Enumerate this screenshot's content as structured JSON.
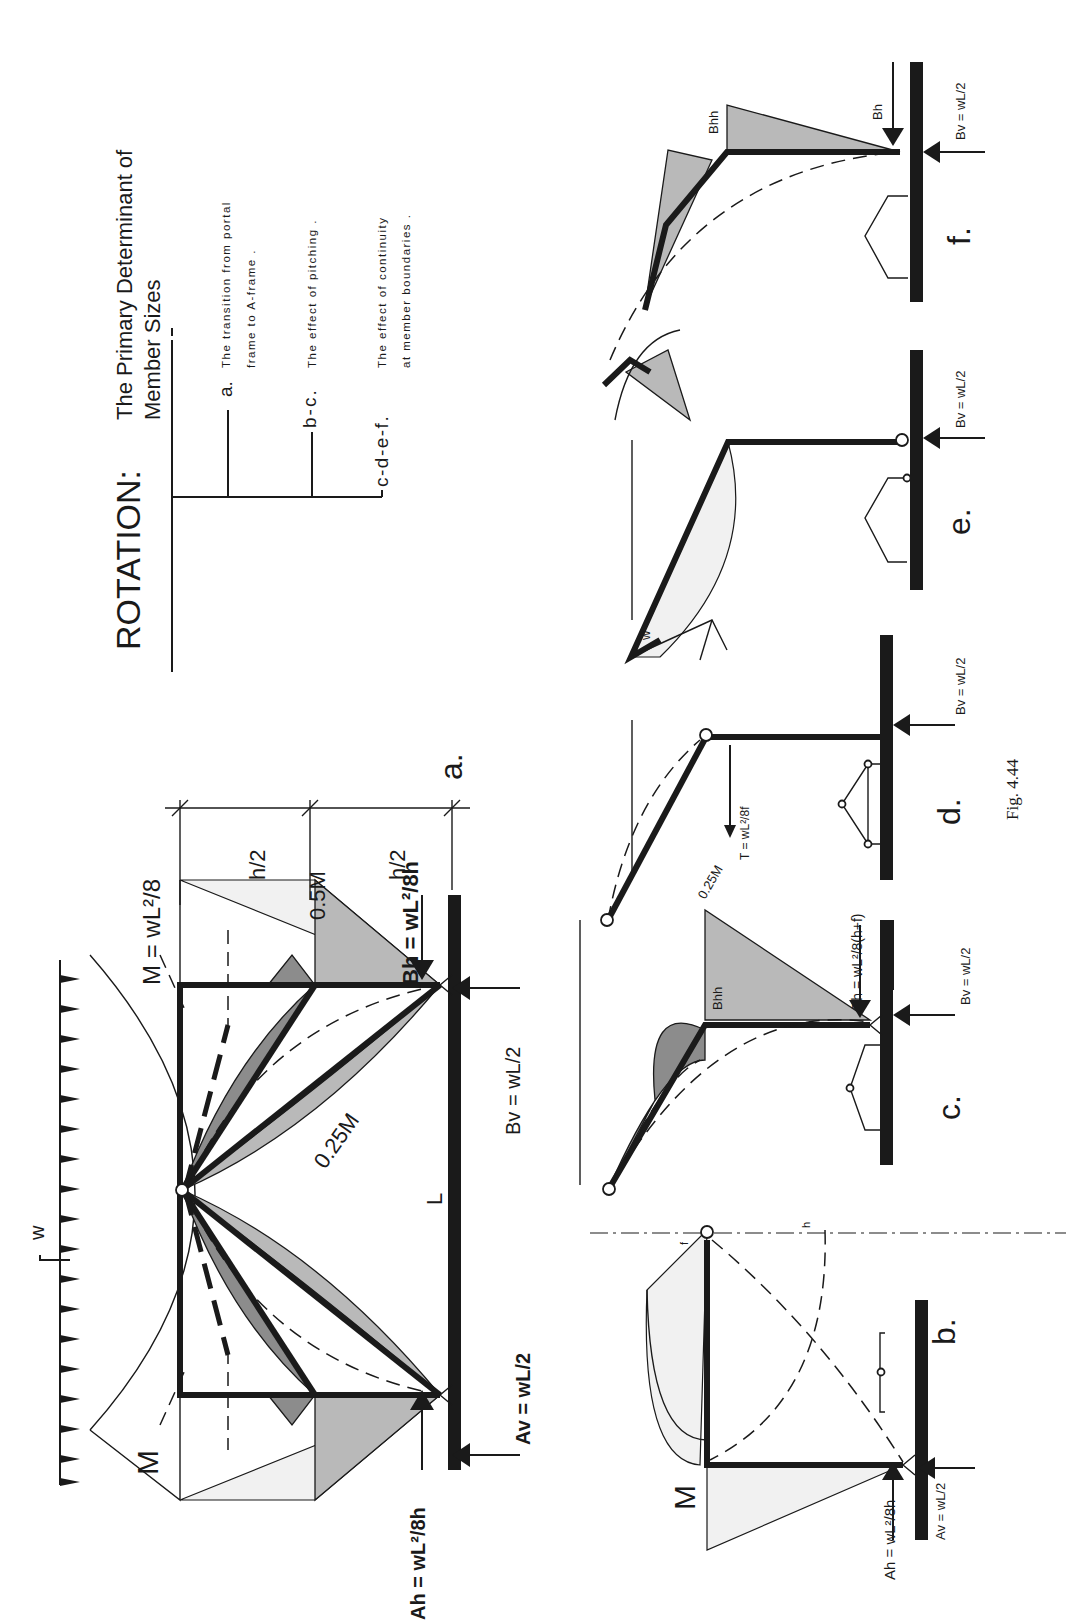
{
  "title": {
    "heading": "ROTATION:",
    "subtitle_line1": "The Primary Determinant of",
    "subtitle_line2": "Member Sizes"
  },
  "legend": [
    {
      "key": "a.",
      "line1": "The transition from portal",
      "line2": "frame to A-frame ."
    },
    {
      "key": "b-c.",
      "line1": "The effect of pitching .",
      "line2": ""
    },
    {
      "key": "c-d-e-f.",
      "line1": "The effect of continuity",
      "line2": "at member boundaries ."
    }
  ],
  "panel_a": {
    "label": "a.",
    "load_label": "w",
    "moment_label": "M",
    "moment_formula": "M = wL²/8",
    "half_moment": "0.5M",
    "quarter_moment": "0.25M",
    "dim_top": "h/2",
    "dim_bottom": "h/2",
    "span_label": "L",
    "Ah": "Ah = wL²/8h",
    "Av": "Av = wL/2",
    "Bh": "Bh = wL²/8h",
    "Bv": "Bv = wL/2"
  },
  "panel_b": {
    "label": "b.",
    "moment_label": "M",
    "f_label": "f",
    "h_label": "h",
    "Ah": "Ah = wL²/8h",
    "Av": "Av = wL/2"
  },
  "panel_c": {
    "label": "c.",
    "moment_label": "Bhh",
    "Bh": "Bh = wL²/8(h+f)",
    "Bv": "Bv = wL/2"
  },
  "panel_d": {
    "label": "d.",
    "quarter_moment": "0.25M",
    "tension": "T = wL²/8f",
    "Bv": "Bv = wL/2"
  },
  "panel_e": {
    "label": "e.",
    "load_label": "w",
    "Bv": "Bv = wL/2"
  },
  "panel_f": {
    "label": "f.",
    "moment_label": "Bhh",
    "Bh": "Bh",
    "Bv": "Bv = wL/2"
  },
  "caption": "Fig. 4.44",
  "colors": {
    "ink": "#1a1a1a",
    "shade_light": "#b9b9b9",
    "shade_dark": "#8c8c8c",
    "paper": "#ffffff"
  }
}
